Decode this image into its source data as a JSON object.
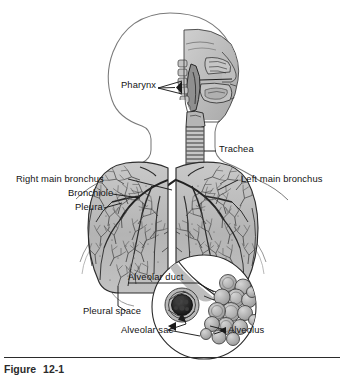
{
  "figure": {
    "caption_label": "Figure",
    "caption_number": "12-1",
    "kind": "anatomical-illustration",
    "palette": {
      "background": "#ffffff",
      "outline": "#6b6b6b",
      "tissue_light": "#d8d8d8",
      "tissue_mid": "#a9a9a9",
      "tissue_dark": "#6e6e6e",
      "capillary_dark": "#1d1d1d",
      "label_text": "#141414",
      "leader_line": "#1a1a1a",
      "rule": "#2b2b2b"
    }
  },
  "labels": [
    {
      "id": "pharynx",
      "text": "Pharynx",
      "x": 121,
      "y": 85,
      "align": "left"
    },
    {
      "id": "trachea",
      "text": "Trachea",
      "x": 219,
      "y": 148,
      "align": "left"
    },
    {
      "id": "right-main-bronchus",
      "text": "Right main bronchus",
      "x": 16,
      "y": 178,
      "align": "left"
    },
    {
      "id": "left-main-bronchus",
      "text": "Left main bronchus",
      "x": 241,
      "y": 178,
      "align": "left"
    },
    {
      "id": "bronchiole",
      "text": "Bronchiole",
      "x": 68,
      "y": 192,
      "align": "left"
    },
    {
      "id": "pleura",
      "text": "Pleura",
      "x": 75,
      "y": 206,
      "align": "left"
    },
    {
      "id": "alveolar-duct",
      "text": "Alveolar duct",
      "x": 128,
      "y": 277,
      "align": "left"
    },
    {
      "id": "pleural-space",
      "text": "Pleural space",
      "x": 83,
      "y": 311,
      "align": "left"
    },
    {
      "id": "alveolar-sac",
      "text": "Alveolar sac",
      "x": 121,
      "y": 330,
      "align": "left"
    },
    {
      "id": "alveolus",
      "text": "Alveolus",
      "x": 228,
      "y": 330,
      "align": "left"
    }
  ]
}
